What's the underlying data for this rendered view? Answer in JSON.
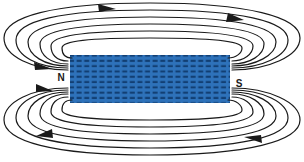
{
  "diagram": {
    "type": "physics-field-line-diagram",
    "canvas": {
      "width": 304,
      "height": 162,
      "background": "#ffffff"
    },
    "magnet": {
      "name": "magnet-body",
      "shape": "rectangle",
      "x": 70,
      "y": 55,
      "width": 160,
      "height": 48,
      "fill_color": "#2E72BA",
      "winding_color": "#123F73",
      "texture": "coil-winding-dashes",
      "winding_rows": 9,
      "winding_cols": 21
    },
    "poles": [
      {
        "label": "N",
        "name": "north-pole-label",
        "x": 61,
        "y": 78,
        "side": "left"
      },
      {
        "label": "S",
        "name": "south-pole-label",
        "x": 238,
        "y": 84,
        "side": "right"
      }
    ],
    "field_lines": {
      "color": "#1a1a1a",
      "stroke_width": 1.2,
      "count_per_half": 6,
      "description": "Concentric closed loops emerging from the N end, arcing over and under the magnet, re-entering at the S end."
    },
    "arrows": {
      "color": "#1a1a1a",
      "count": 8,
      "direction_note": "Field lines run outside the magnet from N to S (left to right over the top, right to left under the bottom)."
    }
  }
}
